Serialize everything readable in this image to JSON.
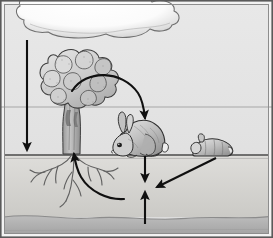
{
  "diagram": {
    "type": "illustration",
    "width": 273,
    "height": 238,
    "palette": {
      "sky": "#e3e3e3",
      "sky_top": "#e7e7e7",
      "cloud_fill": "#ffffff",
      "cloud_shade": "#cfcfcf",
      "cloud_outline": "#6f6f6f",
      "soil": "#d9d8d4",
      "soil_deep": "#cdccc8",
      "bedrock": "#b6b6b6",
      "bedrock_dark": "#a8a8a8",
      "ground_line": "#4a4a4a",
      "arrow": "#101010",
      "frame": "#5a5a5a",
      "frame_inner": "#8d8d8d",
      "tree_foliage": "#c9c9c9",
      "tree_foliage_light": "#dedede",
      "tree_outline": "#3c3c3c",
      "trunk": "#b0b0b0",
      "root": "#707070",
      "rabbit_body": "#b4b4b4",
      "rabbit_light": "#e0e0e0",
      "rabbit_outline": "#2e2e2e",
      "horizon_line": "#a9a9a9"
    },
    "layers": [
      {
        "name": "sky",
        "label": "Atmosphere",
        "y_top": 4,
        "y_bottom": 155
      },
      {
        "name": "soil",
        "label": "Soil",
        "y_top": 155,
        "y_bottom": 215
      },
      {
        "name": "bedrock",
        "label": "Bedrock",
        "y_top": 215,
        "y_bottom": 234
      }
    ],
    "elements": [
      {
        "name": "cloud",
        "label": "Cloud",
        "x": 18,
        "y": 2,
        "width": 160,
        "height": 38
      },
      {
        "name": "tree",
        "label": "Tree",
        "x": 28,
        "y": 46,
        "width": 88,
        "height": 112
      },
      {
        "name": "tree-roots",
        "label": "Tree roots",
        "x": 30,
        "y": 155,
        "width": 82,
        "height": 48
      },
      {
        "name": "rabbit-live",
        "label": "Grazing rabbit",
        "x": 112,
        "y": 115,
        "width": 58,
        "height": 42
      },
      {
        "name": "rabbit-dead",
        "label": "Dead rabbit",
        "x": 192,
        "y": 138,
        "width": 42,
        "height": 20
      }
    ],
    "arrows": [
      {
        "name": "arrow-precipitation-down",
        "label": "Deposition from atmosphere to soil",
        "kind": "straight",
        "from": [
          27,
          40
        ],
        "to": [
          27,
          153
        ]
      },
      {
        "name": "arrow-tree-to-rabbit",
        "label": "Plant material consumed by herbivore",
        "kind": "curved",
        "from": [
          72,
          91
        ],
        "to": [
          145,
          122
        ]
      },
      {
        "name": "arrow-rabbit-to-soil",
        "label": "Waste and remains enter soil",
        "kind": "straight",
        "from": [
          145,
          155
        ],
        "to": [
          145,
          184
        ]
      },
      {
        "name": "arrow-dead-rabbit-to-soil",
        "label": "Decomposition of dead animal into soil",
        "kind": "straight",
        "from": [
          214,
          157
        ],
        "to": [
          155,
          189
        ]
      },
      {
        "name": "arrow-soil-up",
        "label": "Nutrients rise from deep soil",
        "kind": "straight",
        "from": [
          145,
          224
        ],
        "to": [
          145,
          190
        ]
      },
      {
        "name": "arrow-soil-to-roots",
        "label": "Nutrient uptake by roots",
        "kind": "curved",
        "from": [
          125,
          199
        ],
        "to": [
          73,
          152
        ]
      }
    ]
  }
}
